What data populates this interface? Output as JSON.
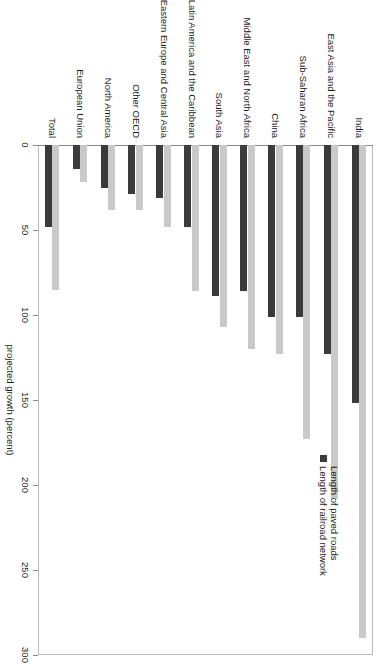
{
  "chart_data": {
    "type": "bar",
    "orientation": "vertical-rendered-rotated",
    "title": "",
    "subtitle": "",
    "xlabel": "",
    "ylabel": "projected growth (percent)",
    "ylim": [
      0,
      300
    ],
    "grid": false,
    "legend_position": "upper-right",
    "tick_labels": [
      "0",
      "50",
      "100",
      "150",
      "200",
      "250",
      "300"
    ],
    "ticks": [
      0,
      50,
      100,
      150,
      200,
      250,
      300
    ],
    "categories": [
      "India",
      "East Asia and the Pacific",
      "Sub-Saharan Africa",
      "China",
      "Middle East and North Africa",
      "South Asia",
      "Latin America and the Caribbean",
      "Eastern Europe and Central Asia",
      "Other OECD",
      "North America",
      "European Union",
      "Total"
    ],
    "series": [
      {
        "name": "Length of paved roads",
        "color": "#c9c9c9",
        "values": [
          290,
          208,
          173,
          123,
          120,
          107,
          86,
          48,
          38,
          38,
          22,
          85
        ]
      },
      {
        "name": "Length of railroad network",
        "color": "#3b3b3b",
        "values": [
          152,
          123,
          101,
          101,
          86,
          89,
          48,
          31,
          29,
          25,
          14,
          48
        ]
      }
    ]
  },
  "legend": {
    "entries": [
      {
        "label": "Length of paved roads",
        "color": "#c9c9c9"
      },
      {
        "label": "Length of railroad network",
        "color": "#3b3b3b"
      }
    ]
  },
  "axis": {
    "value_axis_title": "projected growth (percent)"
  }
}
